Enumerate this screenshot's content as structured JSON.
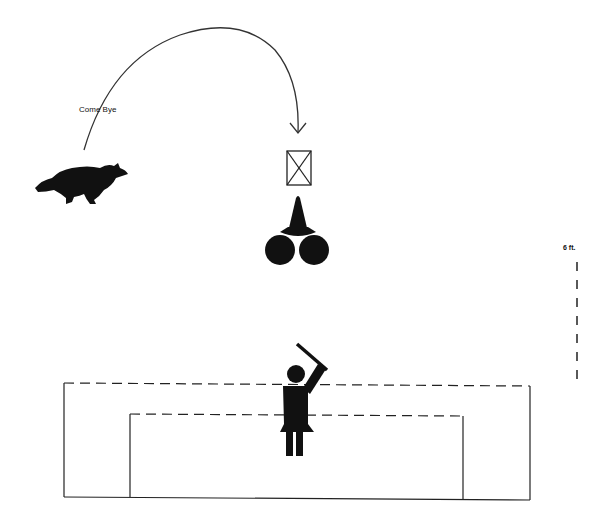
{
  "diagram": {
    "command_label": "Come Bye",
    "distance_label": "6 ft.",
    "elements": {
      "dog": "dog-running-icon",
      "target_marker": "box-with-x-icon",
      "cone": "traffic-cone-icon",
      "sheep": "sheep-circles-icon",
      "handler": "handler-with-stick-icon",
      "outer_pen": "outer-pen-outline",
      "inner_pen": "inner-pen-outline",
      "path_arrow": "curved-arrow-path"
    },
    "colors": {
      "ink": "#111111",
      "line": "#333333",
      "background": "#ffffff"
    }
  }
}
